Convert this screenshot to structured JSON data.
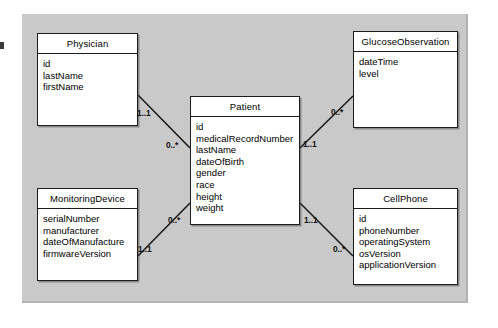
{
  "diagram": {
    "type": "uml-class-diagram",
    "background_color": "#c9c9c9",
    "page_color": "#ffffff",
    "border_color": "#1c1c1c",
    "classes": [
      {
        "id": "physician",
        "name": "Physician",
        "attributes": [
          "id",
          "lastName",
          "firstName"
        ]
      },
      {
        "id": "glucoseobservation",
        "name": "GlucoseObservation",
        "attributes": [
          "dateTime",
          "level"
        ]
      },
      {
        "id": "patient",
        "name": "Patient",
        "attributes": [
          "id",
          "medicalRecordNumber",
          "lastName",
          "dateOfBirth",
          "gender",
          "race",
          "height",
          "weight"
        ]
      },
      {
        "id": "monitoringdevice",
        "name": "MonitoringDevice",
        "attributes": [
          "serialNumber",
          "manufacturer",
          "dateOfManufacture",
          "firmwareVersion"
        ]
      },
      {
        "id": "cellphone",
        "name": "CellPhone",
        "attributes": [
          "id",
          "phoneNumber",
          "operatingSystem",
          "osVersion",
          "applicationVersion"
        ]
      }
    ],
    "associations": [
      {
        "id": "physician-patient",
        "from": "Physician",
        "to": "Patient",
        "from_multiplicity": "1..1",
        "to_multiplicity": "0..*"
      },
      {
        "id": "patient-glucoseobservation",
        "from": "Patient",
        "to": "GlucoseObservation",
        "from_multiplicity": "1..1",
        "to_multiplicity": "0..*"
      },
      {
        "id": "monitoringdevice-patient",
        "from": "MonitoringDevice",
        "to": "Patient",
        "from_multiplicity": "1..1",
        "to_multiplicity": "0..*"
      },
      {
        "id": "patient-cellphone",
        "from": "Patient",
        "to": "CellPhone",
        "from_multiplicity": "1..1",
        "to_multiplicity": "0..*"
      }
    ]
  }
}
